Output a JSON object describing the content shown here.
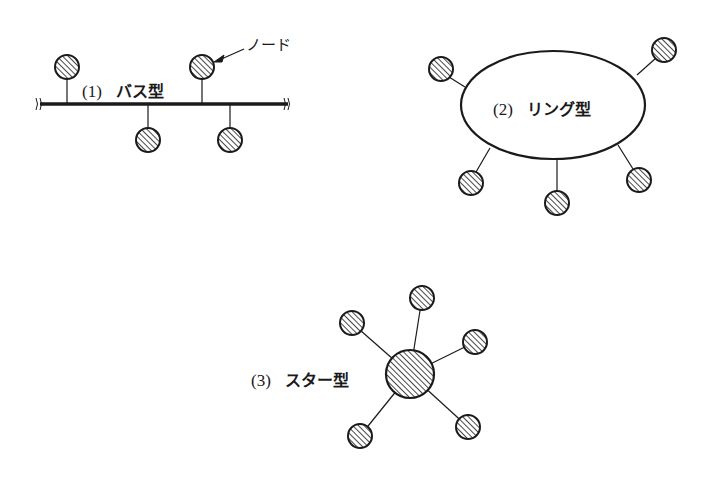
{
  "diagrams": [
    {
      "id": "bus",
      "number": "(1)",
      "title": "バス型"
    },
    {
      "id": "ring",
      "number": "(2)",
      "title": "リング型"
    },
    {
      "id": "star",
      "number": "(3)",
      "title": "スター型"
    }
  ],
  "annotation": {
    "node_label": "ノード"
  },
  "colors": {
    "ink": "#1a1a1a",
    "background": "#ffffff"
  }
}
